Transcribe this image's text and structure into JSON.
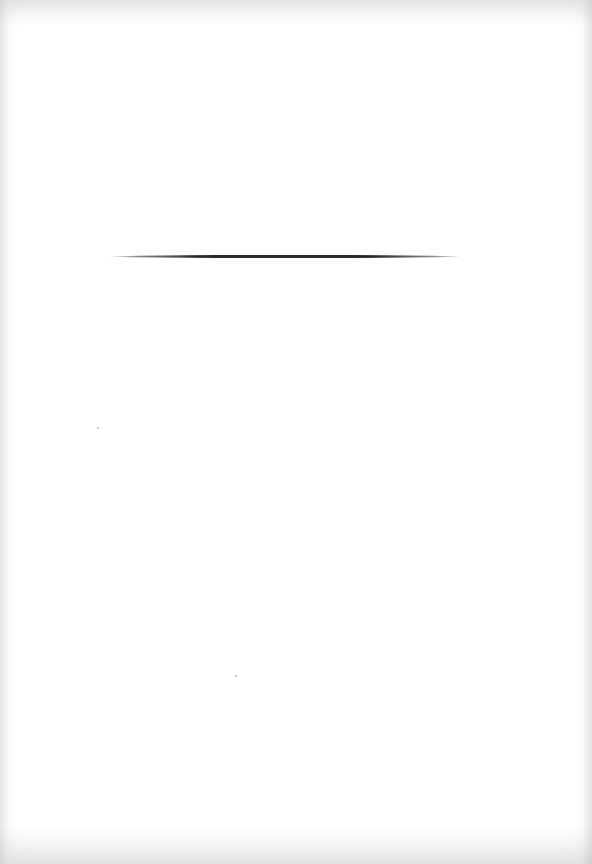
{
  "document": {
    "type": "blank scanned page",
    "elements": [
      {
        "kind": "horizontal-rule",
        "x_start": 108,
        "x_end": 462,
        "y": 257
      }
    ],
    "text": ""
  }
}
